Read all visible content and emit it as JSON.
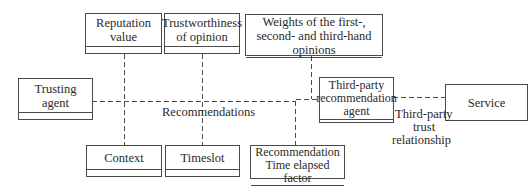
{
  "diagram": {
    "type": "uml-class-association",
    "boxes": {
      "trusting_agent": "Trusting agent",
      "reputation_value": "Reputation value",
      "trustworthiness": "Trustworthiness of opinion",
      "weights": "Weights of the first-, second- and third-hand opinions",
      "third_party_agent": "Third-party recommendation agent",
      "service": "Service",
      "context": "Context",
      "timeslot": "Timeslot",
      "time_elapsed": "Recommendation Time elapsed factor"
    },
    "labels": {
      "recommendations": "Recommendations",
      "third_party_trust_l1": "Third-party",
      "third_party_trust_l2": "trust",
      "third_party_trust_l3": "relationship"
    },
    "colors": {
      "line": "#4a4a4a",
      "background": "#ffffff"
    }
  }
}
